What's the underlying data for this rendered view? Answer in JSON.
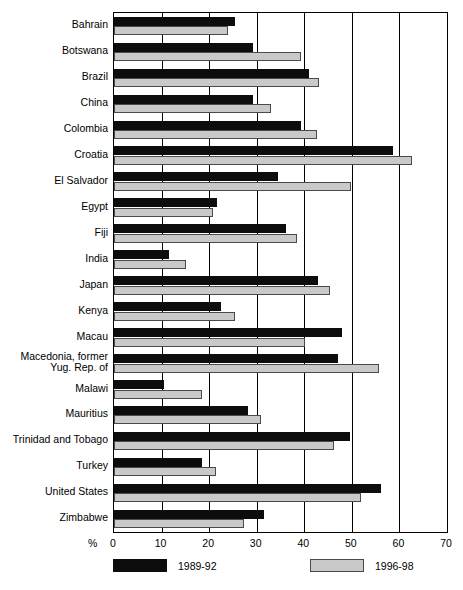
{
  "chart_data": {
    "type": "bar",
    "orientation": "horizontal",
    "title": "",
    "xlabel": "%",
    "ylabel": "",
    "xlim": [
      0,
      70
    ],
    "xticks": [
      0,
      10,
      20,
      30,
      40,
      50,
      60,
      70
    ],
    "xtick_labels": [
      "0",
      "10",
      "20",
      "30",
      "40",
      "50",
      "60",
      "70"
    ],
    "grid": true,
    "legend_position": "bottom",
    "categories": [
      "Bahrain",
      "Botswana",
      "Brazil",
      "China",
      "Colombia",
      "Croatia",
      "El Salvador",
      "Egypt",
      "Fiji",
      "India",
      "Japan",
      "Kenya",
      "Macau",
      "Macedonia, former\nYug. Rep. of",
      "Malawi",
      "Mauritius",
      "Trinidad and Tobago",
      "Turkey",
      "United States",
      "Zimbabwe"
    ],
    "series": [
      {
        "name": "1989-92",
        "color": "#0d0d0d",
        "values": [
          25.5,
          29.2,
          41.0,
          29.2,
          39.3,
          58.6,
          34.5,
          21.6,
          36.2,
          11.6,
          42.9,
          22.5,
          48.0,
          47.1,
          10.5,
          28.2,
          49.6,
          18.6,
          56.1,
          31.5
        ]
      },
      {
        "name": "1996-98",
        "color": "#c9c9c9",
        "values": [
          24.0,
          39.3,
          43.0,
          33.0,
          42.7,
          62.6,
          49.8,
          20.8,
          38.5,
          15.1,
          45.4,
          25.4,
          40.2,
          55.7,
          18.6,
          31.0,
          46.2,
          21.5,
          52.0,
          27.3
        ]
      }
    ]
  },
  "legend": {
    "items": [
      {
        "label": "1989-92",
        "swatch": "dark"
      },
      {
        "label": "1996-98",
        "swatch": "light"
      }
    ]
  },
  "axis": {
    "unit_label": "%"
  }
}
